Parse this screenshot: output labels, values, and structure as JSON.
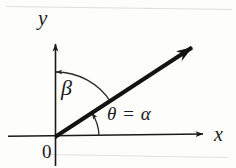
{
  "figure": {
    "kind": "angle-diagram",
    "background_color": "#fdfdfb",
    "ink_color": "#1a1a1a",
    "faint_line_color": "#d8d8d4"
  },
  "labels": {
    "y_axis": "y",
    "x_axis": "x",
    "origin": "0",
    "beta": "β",
    "theta_equals_alpha": "θ = α"
  },
  "geometry": {
    "origin": {
      "x": 55,
      "y": 137
    },
    "x_axis": {
      "start_x": 8,
      "end_x": 208,
      "y": 137
    },
    "y_axis": {
      "x": 55,
      "top_y": 40,
      "bottom_y": 166
    },
    "ray": {
      "from_x": 55,
      "from_y": 137,
      "to_x": 196,
      "to_y": 44,
      "angle_degrees": 33,
      "stroke_width": 4
    },
    "theta_arc": {
      "radius": 44,
      "from_degrees": 0,
      "to_degrees": 33,
      "arrow_at": "ray"
    },
    "beta_arc": {
      "radius": 65,
      "from_degrees": 33,
      "to_degrees": 90,
      "arrow_at": "y-axis"
    }
  }
}
